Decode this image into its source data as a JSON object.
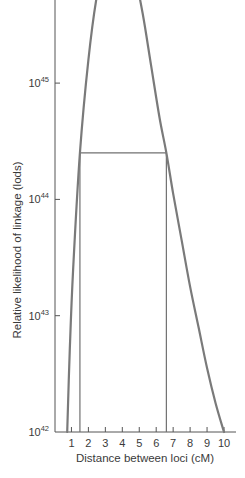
{
  "chart_data": {
    "type": "line",
    "title": "",
    "xlabel": "Distance between loci (cM)",
    "ylabel": "Relative likelihood of linkage (lods)",
    "xlim": [
      0,
      10
    ],
    "x_ticks": [
      1,
      2,
      3,
      4,
      5,
      6,
      7,
      8,
      9,
      10
    ],
    "x_tick_labels": [
      "1",
      "2",
      "3",
      "4",
      "5",
      "6",
      "7",
      "8",
      "9",
      "10"
    ],
    "y_scale": "log",
    "ylim_exponent": [
      42,
      46.3
    ],
    "y_ticks": [
      {
        "base": "10",
        "exponent": "42",
        "value_exponent": 42
      },
      {
        "base": "10",
        "exponent": "43",
        "value_exponent": 43
      },
      {
        "base": "10",
        "exponent": "44",
        "value_exponent": 44
      },
      {
        "base": "10",
        "exponent": "45",
        "value_exponent": 45
      }
    ],
    "grid": false,
    "legend": null,
    "series": [
      {
        "name": "likelihood curve",
        "x": [
          0.75,
          0.9,
          1.1,
          1.5,
          2.0,
          2.5,
          3.0,
          3.5,
          3.8,
          4.2,
          4.7,
          5.2,
          5.7,
          6.2,
          6.6,
          7.0,
          7.5,
          8.0,
          8.5,
          9.0,
          9.5,
          10.0
        ],
        "y_exponent": [
          42.0,
          42.7,
          43.4,
          44.4,
          45.2,
          45.75,
          46.05,
          46.2,
          46.22,
          46.17,
          45.95,
          45.6,
          45.15,
          44.7,
          44.4,
          44.05,
          43.65,
          43.25,
          42.9,
          42.55,
          42.25,
          42.0
        ]
      }
    ],
    "annotations": {
      "confidence_box": {
        "x_left": 1.5,
        "x_right": 6.6,
        "y_top_exponent": 44.4,
        "y_bottom_exponent": 42.0
      }
    }
  }
}
